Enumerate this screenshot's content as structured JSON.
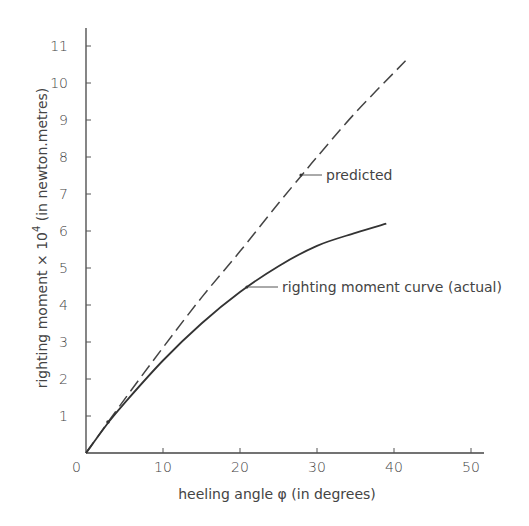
{
  "chart_data": {
    "type": "line",
    "title": "",
    "xlabel": "heeling angle  φ  (in degrees)",
    "ylabel": "righting moment × 10⁴  (in newton.metres)",
    "ylabel_parts": {
      "main": "righting moment × 10",
      "sup": "4",
      "tail": "  (in newton.metres)"
    },
    "xlim": [
      0,
      52
    ],
    "ylim": [
      0,
      11.5
    ],
    "xticks": [
      0,
      10,
      20,
      30,
      40,
      50
    ],
    "xtick_labels": [
      "0",
      "10",
      "20",
      "30",
      "40",
      "50"
    ],
    "yticks": [
      1,
      2,
      3,
      4,
      5,
      6,
      7,
      8,
      9,
      10,
      11
    ],
    "ytick_labels": [
      "1",
      "2",
      "3",
      "4",
      "5",
      "6",
      "7",
      "8",
      "9",
      "10",
      "11"
    ],
    "grid": false,
    "legend": "none (inline annotations)",
    "series": [
      {
        "name": "predicted",
        "style": "dashed",
        "x": [
          0,
          5,
          10,
          15,
          20,
          25,
          28,
          30,
          35,
          41.5
        ],
        "y": [
          0,
          1.45,
          2.85,
          4.2,
          5.45,
          6.75,
          7.5,
          8.0,
          9.2,
          10.6
        ]
      },
      {
        "name": "righting moment curve (actual)",
        "style": "solid",
        "x": [
          0,
          3,
          5,
          10,
          15,
          20,
          25,
          30,
          35,
          39
        ],
        "y": [
          0,
          0.85,
          1.35,
          2.5,
          3.5,
          4.35,
          5.05,
          5.6,
          5.95,
          6.2
        ]
      }
    ],
    "annotations": [
      {
        "text": "predicted",
        "point": [
          28,
          7.5
        ]
      },
      {
        "text": "righting moment curve (actual)",
        "point": [
          21,
          4.5
        ]
      }
    ]
  },
  "labels": {
    "origin": "0",
    "predicted": "predicted",
    "actual": "righting moment curve (actual)",
    "xlabel": "heeling angle  φ  (in degrees)",
    "ylabel_main": "righting moment × 10",
    "ylabel_sup": "4",
    "ylabel_tail": " (in newton.metres)"
  },
  "colors": {
    "line": "#333333",
    "axis": "#444444",
    "text": "#444444"
  }
}
